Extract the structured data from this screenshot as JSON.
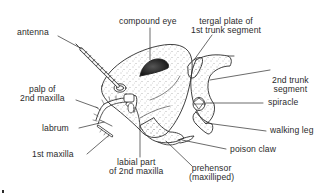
{
  "diagram": {
    "line_color": "#2b2b2b",
    "eye_color": "#1e1e1e",
    "stipple_color": "#6a6a6a",
    "labels": [
      {
        "id": "antenna",
        "lines": [
          "antenna"
        ]
      },
      {
        "id": "compound-eye",
        "lines": [
          "compound eye"
        ]
      },
      {
        "id": "tergal-plate",
        "lines": [
          "tergal plate of",
          "1st trunk segment"
        ]
      },
      {
        "id": "second-trunk-segment",
        "lines": [
          "2nd trunk",
          "segment"
        ]
      },
      {
        "id": "spiracle",
        "lines": [
          "spiracle"
        ]
      },
      {
        "id": "walking-leg",
        "lines": [
          "walking leg"
        ]
      },
      {
        "id": "poison-claw",
        "lines": [
          "poison claw"
        ]
      },
      {
        "id": "prehensor",
        "lines": [
          "prehensor",
          "(maxilliped)"
        ]
      },
      {
        "id": "labial-part",
        "lines": [
          "labial part",
          "of 2nd maxilla"
        ]
      },
      {
        "id": "first-maxilla",
        "lines": [
          "1st maxilla"
        ]
      },
      {
        "id": "labrum",
        "lines": [
          "labrum"
        ]
      },
      {
        "id": "palp-second-maxilla",
        "lines": [
          "palp of",
          "2nd maxilla"
        ]
      }
    ]
  }
}
